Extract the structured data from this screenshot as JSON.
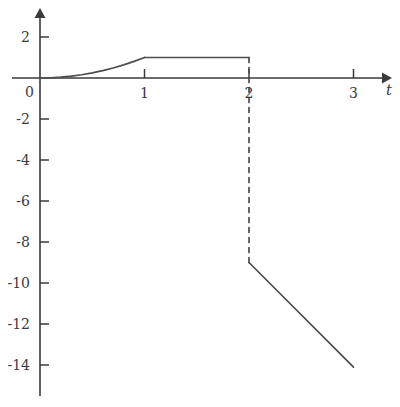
{
  "chart_data": {
    "type": "line",
    "title": "",
    "subtitle": "",
    "xlabel": "t",
    "ylabel": "",
    "xlim": [
      -0.38,
      3.28
    ],
    "ylim": [
      -15.9,
      2.9
    ],
    "grid": false,
    "legend": null,
    "x_ticks": [
      1,
      2,
      3
    ],
    "x_tick_labels": [
      "1",
      "2",
      "3"
    ],
    "y_ticks": [
      2,
      0,
      -2,
      -4,
      -6,
      -8,
      -10,
      -12,
      -14
    ],
    "y_tick_labels": [
      "2",
      "0",
      "-2",
      "-4",
      "-6",
      "-8",
      "-10",
      "-12",
      "-14"
    ],
    "origin_label": "0",
    "axis_arrow_x": true,
    "axis_arrow_y": true,
    "series": [
      {
        "name": "rise",
        "style": "solid",
        "color": "#4d4d4d",
        "description": "smooth convex rise from 0 to 1 on t in [0,1]",
        "points": [
          {
            "x": 0.0,
            "y": 0.0
          },
          {
            "x": 0.1,
            "y": 0.01
          },
          {
            "x": 0.2,
            "y": 0.04
          },
          {
            "x": 0.3,
            "y": 0.09
          },
          {
            "x": 0.4,
            "y": 0.16
          },
          {
            "x": 0.5,
            "y": 0.25
          },
          {
            "x": 0.6,
            "y": 0.36
          },
          {
            "x": 0.7,
            "y": 0.49
          },
          {
            "x": 0.8,
            "y": 0.64
          },
          {
            "x": 0.9,
            "y": 0.81
          },
          {
            "x": 1.0,
            "y": 1.0
          }
        ]
      },
      {
        "name": "plateau",
        "style": "solid",
        "color": "#4d4d4d",
        "description": "constant value 1 on t in [1,2]",
        "points": [
          {
            "x": 1.0,
            "y": 1.0
          },
          {
            "x": 2.0,
            "y": 1.0
          }
        ]
      },
      {
        "name": "jump",
        "style": "dashed",
        "color": "#4d4d4d",
        "description": "vertical discontinuity at t = 2 from 1 down to -9",
        "points": [
          {
            "x": 2.0,
            "y": 1.0
          },
          {
            "x": 2.0,
            "y": -9.0
          }
        ]
      },
      {
        "name": "descent",
        "style": "solid",
        "color": "#4d4d4d",
        "description": "linear decrease from -9 to -14.1 on t in [2,3]",
        "points": [
          {
            "x": 2.0,
            "y": -9.0
          },
          {
            "x": 3.0,
            "y": -14.1
          }
        ]
      }
    ],
    "annotations": []
  },
  "colors": {
    "background": "#ffffff",
    "axis": "#3a3a3a",
    "curve": "#4d4d4d",
    "text": "#3a3a3a"
  }
}
